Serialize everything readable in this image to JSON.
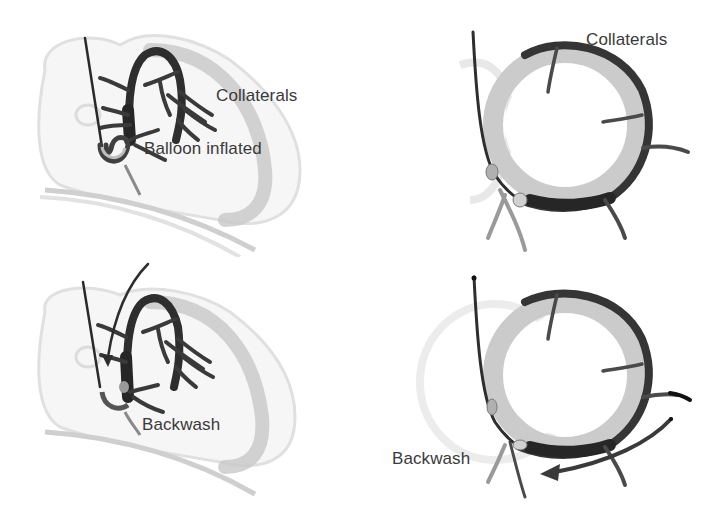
{
  "figure": {
    "panels": [
      {
        "id": "top-left",
        "view": "lateral",
        "labels": [
          "Collaterals",
          "Balloon inflated"
        ]
      },
      {
        "id": "top-right",
        "view": "short-axis",
        "labels": [
          "Collaterals"
        ]
      },
      {
        "id": "bottom-left",
        "view": "lateral",
        "labels": [
          "Backwash"
        ]
      },
      {
        "id": "bottom-right",
        "view": "short-axis",
        "labels": [
          "Backwash"
        ]
      }
    ]
  },
  "colors": {
    "background": "#ffffff",
    "vessel_dark": "#2e2e2e",
    "vessel_mid": "#6a6a6a",
    "myocardium": "#c4c4c4",
    "heart_outline": "#dedede",
    "text": "#3a3a3a"
  }
}
